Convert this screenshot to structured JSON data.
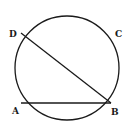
{
  "diagram": {
    "type": "circle-geometry",
    "circle": {
      "cx": 67,
      "cy": 68,
      "r": 52,
      "stroke": "#1a1a1a"
    },
    "points": [
      {
        "label": "D",
        "x": 21,
        "y": 33,
        "label_x": 9,
        "label_y": 37
      },
      {
        "label": "C",
        "x": 112,
        "y": 33,
        "label_x": 115,
        "label_y": 37
      },
      {
        "label": "A",
        "x": 21,
        "y": 103,
        "label_x": 12,
        "label_y": 114
      },
      {
        "label": "B",
        "x": 111,
        "y": 103,
        "label_x": 111,
        "label_y": 115
      }
    ],
    "segments": [
      {
        "name": "chord-DB",
        "from": "D",
        "to": "B"
      },
      {
        "name": "chord-AB",
        "from": "A",
        "to": "B"
      }
    ]
  }
}
